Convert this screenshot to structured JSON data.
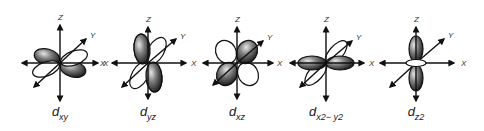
{
  "figure": {
    "type": "d-orbital shapes",
    "axis_labels": {
      "z": "Z",
      "y": "Y",
      "x": "X"
    },
    "colors": {
      "shaded_lobe": "#2a2a2a",
      "lobe_highlight": "#d8d8d8",
      "outline": "#111111",
      "background": "#ffffff"
    },
    "orbitals": [
      {
        "id": "dxy",
        "main": "d",
        "sub": "xy",
        "center_x": 60
      },
      {
        "id": "dyz",
        "main": "d",
        "sub": "yz",
        "center_x": 148
      },
      {
        "id": "dxz",
        "main": "d",
        "sub": "xz",
        "center_x": 237
      },
      {
        "id": "dx2-y2",
        "main": "d",
        "sub": "x2− y2",
        "center_x": 326
      },
      {
        "id": "dz2",
        "main": "d",
        "sub": "z2",
        "center_x": 416
      }
    ]
  }
}
